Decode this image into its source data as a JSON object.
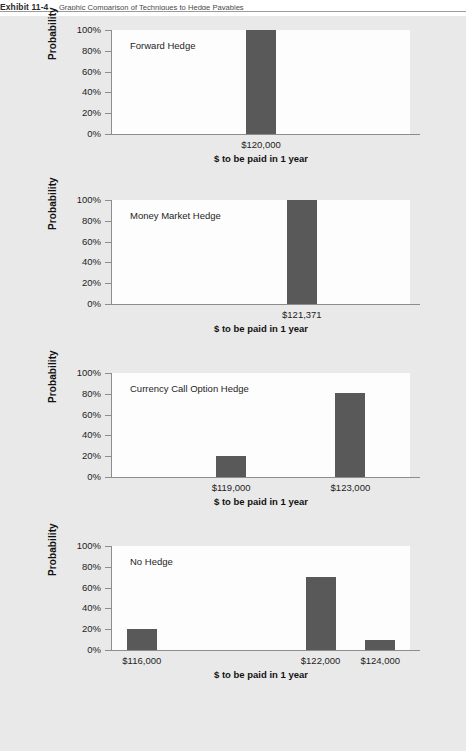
{
  "exhibit": {
    "label": "Exhibit 11-4",
    "title": "Graphic Comparison of Techniques to Hedge Payables"
  },
  "axis": {
    "y_title": "Probability",
    "x_title": "$ to be paid in 1 year",
    "y_ticks": [
      "0%",
      "20%",
      "40%",
      "60%",
      "80%",
      "100%"
    ]
  },
  "chart_data": [
    {
      "type": "bar",
      "title": "Forward Hedge",
      "categories": [
        "$120,000"
      ],
      "values": [
        100
      ],
      "xlabel": "$ to be paid in 1 year",
      "ylabel": "Probability",
      "ylim": [
        0,
        100
      ],
      "xlim": [
        115000,
        125000
      ],
      "x_positions": [
        120000
      ],
      "grid": false,
      "legend": "none"
    },
    {
      "type": "bar",
      "title": "Money Market Hedge",
      "categories": [
        "$121,371"
      ],
      "values": [
        100
      ],
      "xlabel": "$ to be paid in 1 year",
      "ylabel": "Probability",
      "ylim": [
        0,
        100
      ],
      "xlim": [
        115000,
        125000
      ],
      "x_positions": [
        121371
      ],
      "grid": false,
      "legend": "none"
    },
    {
      "type": "bar",
      "title": "Currency Call Option Hedge",
      "categories": [
        "$119,000",
        "$123,000"
      ],
      "values": [
        20,
        81
      ],
      "xlabel": "$ to be paid in 1 year",
      "ylabel": "Probability",
      "ylim": [
        0,
        100
      ],
      "xlim": [
        115000,
        125000
      ],
      "x_positions": [
        119000,
        123000
      ],
      "grid": false,
      "legend": "none"
    },
    {
      "type": "bar",
      "title": "No Hedge",
      "categories": [
        "$116,000",
        "$122,000",
        "$124,000"
      ],
      "values": [
        20,
        70,
        10
      ],
      "xlabel": "$ to be paid in 1 year",
      "ylabel": "Probability",
      "ylim": [
        0,
        100
      ],
      "xlim": [
        115000,
        125000
      ],
      "x_positions": [
        116000,
        122000,
        124000
      ],
      "grid": false,
      "legend": "none"
    }
  ],
  "style": {
    "bar_color": "#595959",
    "panel_background": "#e9e9e9",
    "plot_background": "#fdfdfd",
    "axis_color": "#8d8d8d"
  }
}
